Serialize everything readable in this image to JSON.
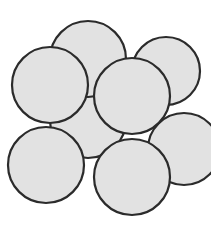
{
  "figure": {
    "width": 211,
    "height": 226,
    "background_color": "#ffffff"
  },
  "style": {
    "sphere_fill": "#e2e2e2",
    "sphere_stroke": "#2b2b2b",
    "sphere_stroke_width": 2.2
  },
  "chart_data": {
    "type": "diagram",
    "subtype": "circle-packing",
    "xlabel": "",
    "ylabel": "",
    "xlim": [
      0,
      211
    ],
    "ylim": [
      0,
      226
    ],
    "grid": false,
    "legend": false,
    "units": "pixels",
    "shape": "circle",
    "count": 8,
    "fill_color": "#e2e2e2",
    "stroke_color": "#2b2b2b",
    "stroke_width": 2.2,
    "circles": [
      {
        "id": "sphere-center-back",
        "label": "center back sphere",
        "cx": 88,
        "cy": 120,
        "r": 38,
        "z": 1
      },
      {
        "id": "sphere-top-middle",
        "label": "top middle sphere",
        "cx": 88,
        "cy": 59,
        "r": 38,
        "z": 2
      },
      {
        "id": "sphere-top-right",
        "label": "top right sphere",
        "cx": 166,
        "cy": 71,
        "r": 34,
        "z": 3
      },
      {
        "id": "sphere-middle-left",
        "label": "middle left sphere",
        "cx": 50,
        "cy": 85,
        "r": 38,
        "z": 4
      },
      {
        "id": "sphere-middle-right",
        "label": "middle right sphere",
        "cx": 184,
        "cy": 149,
        "r": 36,
        "z": 5
      },
      {
        "id": "sphere-center-front",
        "label": "center front sphere",
        "cx": 132,
        "cy": 96,
        "r": 38,
        "z": 6
      },
      {
        "id": "sphere-bottom-left",
        "label": "bottom left sphere",
        "cx": 46,
        "cy": 165,
        "r": 38,
        "z": 7
      },
      {
        "id": "sphere-bottom-middle",
        "label": "bottom middle sphere",
        "cx": 132,
        "cy": 177,
        "r": 38,
        "z": 8
      }
    ]
  }
}
